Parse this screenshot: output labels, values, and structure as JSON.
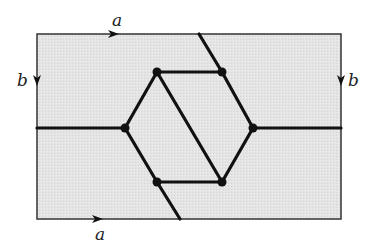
{
  "diagram": {
    "type": "graph-on-torus",
    "colors": {
      "fill": "#e6e6e6",
      "stroke": "#111111",
      "border": "#333333"
    },
    "rectangle": {
      "x": 37,
      "y": 34,
      "w": 304,
      "h": 185
    },
    "labels": {
      "top": "a",
      "bottom": "a",
      "left": "b",
      "right": "b"
    },
    "vertices": [
      {
        "id": "v1",
        "x": 157,
        "y": 72
      },
      {
        "id": "v2",
        "x": 222,
        "y": 72
      },
      {
        "id": "v3",
        "x": 125,
        "y": 128
      },
      {
        "id": "v4",
        "x": 253,
        "y": 128
      },
      {
        "id": "v5",
        "x": 157,
        "y": 182
      },
      {
        "id": "v6",
        "x": 222,
        "y": 182
      }
    ],
    "edges": [
      {
        "from": "v1",
        "to": "v2"
      },
      {
        "from": "v5",
        "to": "v6"
      },
      {
        "from": "v3",
        "to": "v1"
      },
      {
        "from": "v3",
        "to": "v5"
      },
      {
        "from": "v2",
        "to": "v4"
      },
      {
        "from": "v6",
        "to": "v4"
      },
      {
        "from": "v1",
        "to": "v6"
      },
      {
        "from": "left-edge",
        "to": "v3"
      },
      {
        "from": "v4",
        "to": "right-edge"
      },
      {
        "from": "top-edge",
        "to": "v2"
      },
      {
        "from": "v5",
        "to": "bottom-edge"
      }
    ]
  }
}
